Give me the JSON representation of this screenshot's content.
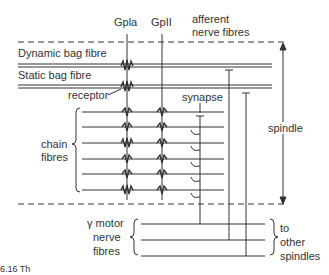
{
  "diagram": {
    "labels": {
      "gpla": "Gpla",
      "gpII": "GpII",
      "afferent_line1": "afferent",
      "afferent_line2": "nerve fibres",
      "dynamic_bag": "Dynamic bag fibre",
      "static_bag": "Static bag fibre",
      "receptor": "receptor",
      "synapse": "synapse",
      "chain_line1": "chain",
      "chain_line2": "fibres",
      "spindle": "spindle",
      "motor_line1": "γ motor",
      "motor_line2": "nerve",
      "motor_line3": "fibres",
      "other_line1": "to",
      "other_line2": "other",
      "other_line3": "spindles",
      "caption_fragment": "6.16 Th"
    },
    "chain_fibre_count": 6,
    "motor_fibre_count": 3,
    "colors": {
      "line": "#333333",
      "background": "#ffffff"
    }
  }
}
